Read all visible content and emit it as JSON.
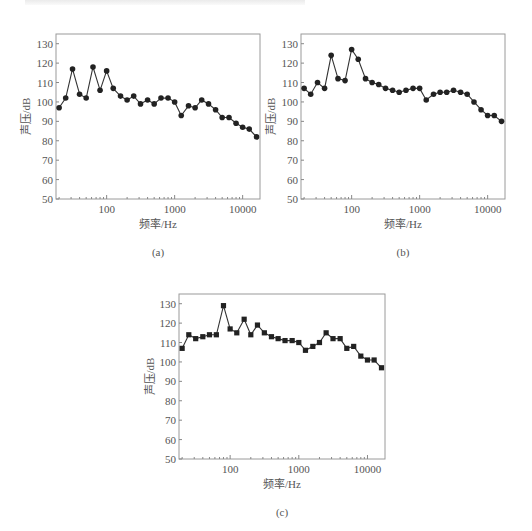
{
  "page": {
    "top_text_fragment": ""
  },
  "chart_data": [
    {
      "id": "a",
      "type": "line",
      "caption": "(a)",
      "title": "",
      "xlabel": "频率/Hz",
      "ylabel": "声压/dB",
      "xscale": "log",
      "xlim": [
        18,
        18000
      ],
      "ylim": [
        50,
        135
      ],
      "xticks": [
        100,
        1000,
        10000
      ],
      "xtick_labels": [
        "100",
        "1000",
        "10000"
      ],
      "yticks": [
        50,
        60,
        70,
        80,
        90,
        100,
        110,
        120,
        130
      ],
      "ytick_labels": [
        "50",
        "60",
        "70",
        "80",
        "90",
        "100",
        "110",
        "120",
        "130"
      ],
      "marker": "circle",
      "grid": false,
      "x": [
        20,
        25,
        31.5,
        40,
        50,
        63,
        80,
        100,
        125,
        160,
        200,
        250,
        315,
        400,
        500,
        630,
        800,
        1000,
        1250,
        1600,
        2000,
        2500,
        3150,
        4000,
        5000,
        6300,
        8000,
        10000,
        12500,
        16000
      ],
      "values": [
        97,
        102,
        117,
        104,
        102,
        118,
        106,
        116,
        107,
        103,
        101,
        103,
        99,
        101,
        99,
        102,
        102,
        100,
        93,
        98,
        97,
        101,
        99,
        96,
        92,
        92,
        89,
        87,
        86,
        82
      ]
    },
    {
      "id": "b",
      "type": "line",
      "caption": "(b)",
      "title": "",
      "xlabel": "频率/Hz",
      "ylabel": "声压/dB",
      "xscale": "log",
      "xlim": [
        18,
        18000
      ],
      "ylim": [
        50,
        135
      ],
      "xticks": [
        100,
        1000,
        10000
      ],
      "xtick_labels": [
        "100",
        "1000",
        "10000"
      ],
      "yticks": [
        50,
        60,
        70,
        80,
        90,
        100,
        110,
        120,
        130
      ],
      "ytick_labels": [
        "50",
        "60",
        "70",
        "80",
        "90",
        "100",
        "110",
        "120",
        "130"
      ],
      "marker": "circle",
      "grid": false,
      "x": [
        20,
        25,
        31.5,
        40,
        50,
        63,
        80,
        100,
        125,
        160,
        200,
        250,
        315,
        400,
        500,
        630,
        800,
        1000,
        1250,
        1600,
        2000,
        2500,
        3150,
        4000,
        5000,
        6300,
        8000,
        10000,
        12500,
        16000
      ],
      "values": [
        107,
        104,
        110,
        107,
        124,
        112,
        111,
        127,
        122,
        112,
        110,
        109,
        107,
        106,
        105,
        106,
        107,
        107,
        101,
        104,
        105,
        105,
        106,
        105,
        104,
        100,
        96,
        93,
        93,
        90
      ]
    },
    {
      "id": "c",
      "type": "line",
      "caption": "(c)",
      "title": "",
      "xlabel": "频率/Hz",
      "ylabel": "声压/dB",
      "xscale": "log",
      "xlim": [
        18,
        18000
      ],
      "ylim": [
        50,
        135
      ],
      "xticks": [
        100,
        1000,
        10000
      ],
      "xtick_labels": [
        "100",
        "1000",
        "10000"
      ],
      "yticks": [
        50,
        60,
        70,
        80,
        90,
        100,
        110,
        120,
        130
      ],
      "ytick_labels": [
        "50",
        "60",
        "70",
        "80",
        "90",
        "100",
        "110",
        "120",
        "130"
      ],
      "marker": "square",
      "grid": false,
      "x": [
        20,
        25,
        31.5,
        40,
        50,
        63,
        80,
        100,
        125,
        160,
        200,
        250,
        315,
        400,
        500,
        630,
        800,
        1000,
        1250,
        1600,
        2000,
        2500,
        3150,
        4000,
        5000,
        6300,
        8000,
        10000,
        12500,
        16000
      ],
      "values": [
        107,
        114,
        112,
        113,
        114,
        114,
        129,
        117,
        115,
        122,
        114,
        119,
        115,
        113,
        112,
        111,
        111,
        110,
        106,
        108,
        110,
        115,
        112,
        112,
        107,
        108,
        103,
        101,
        101,
        97
      ]
    }
  ]
}
